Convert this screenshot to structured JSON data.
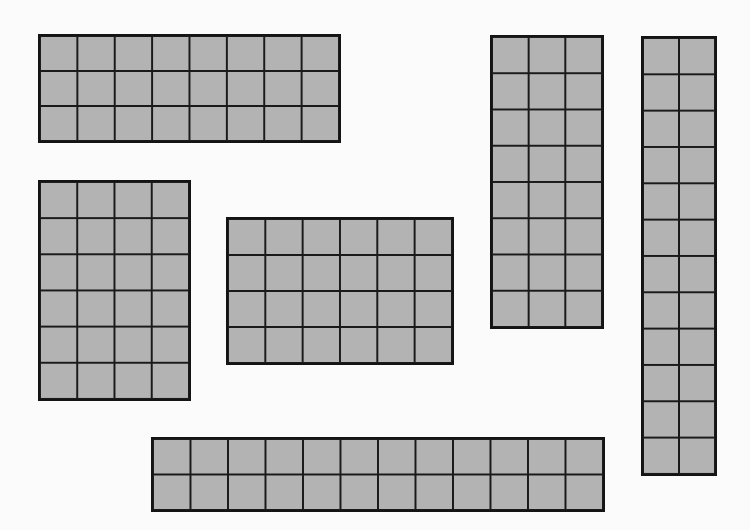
{
  "figure": {
    "fill_color": "#b3b3b3",
    "line_color": "#1a1a1a",
    "background_color": "#fbfbfb",
    "rectangles": [
      {
        "id": "rect-8x3",
        "cols": 8,
        "rows": 3,
        "cells": 24,
        "x": 38,
        "y": 34,
        "w": 303,
        "h": 109
      },
      {
        "id": "rect-4x6",
        "cols": 4,
        "rows": 6,
        "cells": 24,
        "x": 38,
        "y": 180,
        "w": 153,
        "h": 221
      },
      {
        "id": "rect-6x4",
        "cols": 6,
        "rows": 4,
        "cells": 24,
        "x": 226,
        "y": 217,
        "w": 228,
        "h": 148
      },
      {
        "id": "rect-3x8",
        "cols": 3,
        "rows": 8,
        "cells": 24,
        "x": 490,
        "y": 35,
        "w": 114,
        "h": 294
      },
      {
        "id": "rect-2x12",
        "cols": 2,
        "rows": 12,
        "cells": 24,
        "x": 641,
        "y": 36,
        "w": 76,
        "h": 440
      },
      {
        "id": "rect-12x2",
        "cols": 12,
        "rows": 2,
        "cells": 24,
        "x": 151,
        "y": 437,
        "w": 454,
        "h": 75
      }
    ]
  }
}
